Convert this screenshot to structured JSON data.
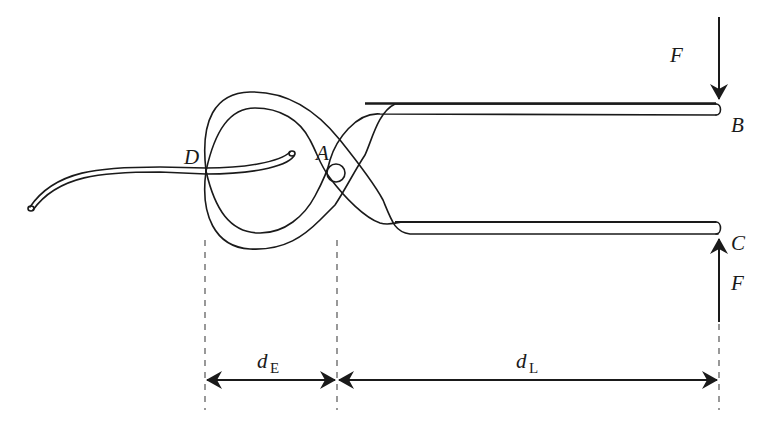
{
  "diagram": {
    "colors": {
      "stroke": "#1a1a1a",
      "dash": "#555555",
      "background": "#ffffff"
    },
    "points": {
      "A": {
        "label": "A",
        "description": "pivot"
      },
      "B": {
        "label": "B",
        "description": "upper handle end"
      },
      "C": {
        "label": "C",
        "description": "lower handle end"
      },
      "D": {
        "label": "D",
        "description": "jaw contact with wire"
      }
    },
    "forces": {
      "top": {
        "label": "F",
        "direction": "down",
        "at": "B"
      },
      "bottom": {
        "label": "F",
        "direction": "up",
        "at": "C"
      }
    },
    "dimensions": {
      "effort": {
        "symbol": "d",
        "subscript": "E",
        "from": "D",
        "to": "A"
      },
      "load": {
        "symbol": "d",
        "subscript": "L",
        "from": "A",
        "to": "B/C"
      }
    }
  }
}
